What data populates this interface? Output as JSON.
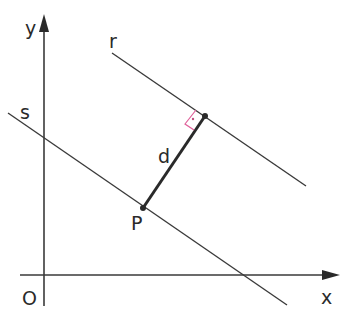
{
  "diagram": {
    "labels": {
      "y_axis": "y",
      "x_axis": "x",
      "origin": "O",
      "line_r": "r",
      "line_s": "s",
      "distance": "d",
      "point_p": "P"
    },
    "colors": {
      "line": "#3a3a3a",
      "right_angle_marker": "#e0609a"
    }
  }
}
